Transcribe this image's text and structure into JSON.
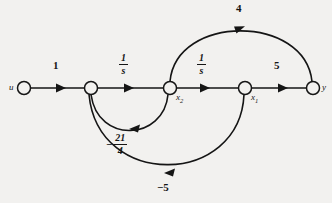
{
  "figure": {
    "type": "signal-flow-graph",
    "background_color": "#f2f1ef",
    "ink_color": "#151515",
    "width": 332,
    "height": 203
  },
  "nodes": [
    {
      "id": "u",
      "label": "u",
      "sub": "",
      "x": 24,
      "y": 88,
      "r": 6.5,
      "label_dx": -13,
      "label_dy": -5
    },
    {
      "id": "n2",
      "label": "",
      "sub": "",
      "x": 91,
      "y": 88,
      "r": 6.5,
      "label_dx": 0,
      "label_dy": 0
    },
    {
      "id": "x2",
      "label": "x",
      "sub": "2",
      "x": 170,
      "y": 88,
      "r": 6.5,
      "label_dx": 6,
      "label_dy": 5
    },
    {
      "id": "x1",
      "label": "x",
      "sub": "1",
      "x": 245,
      "y": 88,
      "r": 6.5,
      "label_dx": 6,
      "label_dy": 5
    },
    {
      "id": "y",
      "label": "y",
      "sub": "",
      "x": 313,
      "y": 88,
      "r": 6.5,
      "label_dx": 8,
      "label_dy": -5
    }
  ],
  "edges": [
    {
      "id": "e-u-n2",
      "from": "u",
      "to": "n2",
      "gain": "1",
      "gain_kind": "plain",
      "numerator": "",
      "denominator": "",
      "sign": "",
      "label_x": 53,
      "label_y": 66
    },
    {
      "id": "e-n2-x2",
      "from": "n2",
      "to": "x2",
      "gain": "1/s",
      "gain_kind": "fraction",
      "numerator": "1",
      "denominator": "s",
      "sign": "",
      "label_x": 124,
      "label_y": 60
    },
    {
      "id": "e-x2-x1",
      "from": "x2",
      "to": "x1",
      "gain": "1/s",
      "gain_kind": "fraction",
      "numerator": "1",
      "denominator": "s",
      "sign": "",
      "label_x": 202,
      "label_y": 60
    },
    {
      "id": "e-x1-y",
      "from": "x1",
      "to": "y",
      "gain": "5",
      "gain_kind": "plain",
      "numerator": "",
      "denominator": "",
      "sign": "",
      "label_x": 277,
      "label_y": 66
    },
    {
      "id": "e-x2-y",
      "from": "x2",
      "to": "y",
      "gain": "4",
      "gain_kind": "plain",
      "numerator": "",
      "denominator": "",
      "sign": "",
      "label_x": 238,
      "label_y": 6
    },
    {
      "id": "e-x2-n2",
      "from": "x2",
      "to": "n2",
      "gain": "-21/4",
      "gain_kind": "fraction",
      "numerator": "21",
      "denominator": "4",
      "sign": "−",
      "label_x": 114,
      "label_y": 137
    },
    {
      "id": "e-x1-n2",
      "from": "x1",
      "to": "n2",
      "gain": "-5",
      "gain_kind": "plain",
      "numerator": "",
      "denominator": "",
      "sign": "",
      "label_x": 161,
      "label_y": 185
    }
  ],
  "gain_labels": {
    "u_to_n2": "1",
    "n2_to_x2_num": "1",
    "n2_to_x2_den": "s",
    "x2_to_x1_num": "1",
    "x2_to_x1_den": "s",
    "x1_to_y": "5",
    "x2_to_y": "4",
    "x2_to_n2_sign": "−",
    "x2_to_n2_num": "21",
    "x2_to_n2_den": "4",
    "x1_to_n2": "−5"
  },
  "node_labels": {
    "u": "u",
    "x2_base": "x",
    "x2_sub": "2",
    "x1_base": "x",
    "x1_sub": "1",
    "y": "y"
  }
}
